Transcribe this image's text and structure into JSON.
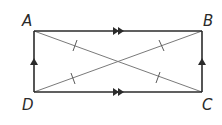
{
  "figure": {
    "type": "rectangle",
    "colors": {
      "side_stroke": "#2b2b2b",
      "diagonal_stroke": "#7a7a7a",
      "label": "#2a2a2a",
      "background": "#ffffff"
    },
    "vertices": [
      {
        "name": "A",
        "x": 34,
        "y": 31
      },
      {
        "name": "B",
        "x": 202,
        "y": 31
      },
      {
        "name": "C",
        "x": 202,
        "y": 92
      },
      {
        "name": "D",
        "x": 34,
        "y": 92
      }
    ],
    "labels": {
      "A": "A",
      "B": "B",
      "C": "C",
      "D": "D"
    },
    "sides": [
      {
        "name": "AB",
        "marking": "double-arrow",
        "direction": "right"
      },
      {
        "name": "DC",
        "marking": "double-arrow",
        "direction": "right"
      },
      {
        "name": "DA",
        "marking": "single-arrow",
        "direction": "up"
      },
      {
        "name": "CB",
        "marking": "single-arrow",
        "direction": "up"
      }
    ],
    "diagonals": [
      {
        "name": "AC",
        "tick_marks": 2,
        "marking": "single-tick"
      },
      {
        "name": "DB",
        "tick_marks": 2,
        "marking": "single-tick"
      }
    ],
    "properties": [
      "AB parallel DC",
      "AD parallel BC",
      "Diagonals bisect each other and are congruent"
    ]
  }
}
